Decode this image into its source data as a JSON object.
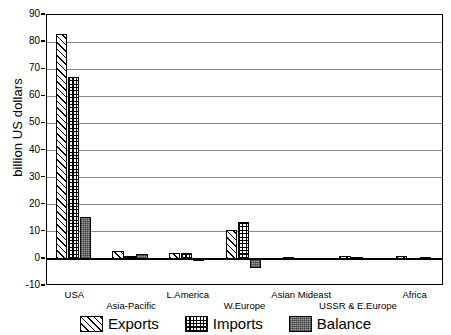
{
  "chart_data": {
    "type": "bar",
    "title": "",
    "subtitle": "",
    "xlabel": "",
    "ylabel": "billion US dollars",
    "ylim": [
      -10,
      90
    ],
    "ytick_step": 10,
    "yticks": [
      "90",
      "80",
      "70",
      "60",
      "50",
      "40",
      "30",
      "20",
      "10",
      "0",
      "-10"
    ],
    "grid": true,
    "grid_axis": "y",
    "legend_position": "bottom",
    "categories": [
      "USA",
      "Asia-Pacific",
      "L.America",
      "W.Europe",
      "Asian Mideast",
      "USSR & E.Europe",
      "Africa"
    ],
    "series": [
      {
        "name": "Exports",
        "pattern": "diagonal-hatch",
        "values": [
          83.0,
          2.9,
          2.2,
          10.5,
          0.6,
          0.9,
          1.2
        ]
      },
      {
        "name": "Imports",
        "pattern": "checkerboard",
        "values": [
          67.2,
          1.1,
          2.1,
          13.7,
          0.5,
          0.7,
          0.5
        ]
      },
      {
        "name": "Balance",
        "pattern": "solid-gray",
        "values": [
          15.6,
          1.7,
          0.1,
          -3.2,
          0.2,
          0.2,
          0.7
        ]
      }
    ]
  },
  "legend": {
    "items": [
      {
        "label": "Exports"
      },
      {
        "label": "Imports"
      },
      {
        "label": "Balance"
      }
    ]
  },
  "colors": {
    "axis": "#000000",
    "gridline": "#8a8a8a",
    "background": "#ffffff",
    "balance_fill": "#9b9b9b"
  }
}
